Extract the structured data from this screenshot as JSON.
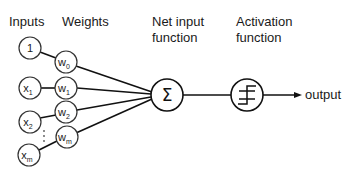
{
  "headers": {
    "inputs": "Inputs",
    "weights": "Weights",
    "net_input_line1": "Net input",
    "net_input_line2": "function",
    "activation_line1": "Activation",
    "activation_line2": "function"
  },
  "inputs": [
    {
      "base": "1",
      "sub": ""
    },
    {
      "base": "x",
      "sub": "1"
    },
    {
      "base": "x",
      "sub": "2"
    },
    {
      "base": "x",
      "sub": "m"
    }
  ],
  "weights": [
    {
      "base": "w",
      "sub": "0"
    },
    {
      "base": "w",
      "sub": "1"
    },
    {
      "base": "w",
      "sub": "2"
    },
    {
      "base": "w",
      "sub": "m"
    }
  ],
  "ellipsis": "⋮",
  "sum_symbol": "Σ",
  "output_label": "output",
  "colors": {
    "stroke": "#111111",
    "text": "#1a1a1a",
    "background": "#ffffff"
  }
}
